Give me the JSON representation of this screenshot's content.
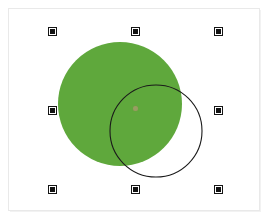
{
  "app": {
    "type": "vector-graphics-canvas",
    "background_color": "#ffffff",
    "width": 268,
    "height": 219
  },
  "canvas": {
    "frame": {
      "x": 8,
      "y": 8,
      "width": 252,
      "height": 203,
      "border_color": "#e9e9e9",
      "fill_color": "#ffffff"
    }
  },
  "shapes": [
    {
      "name": "green-filled-circle",
      "type": "circle",
      "cx": 120,
      "cy": 104,
      "r": 62,
      "fill": "#5FA83C",
      "stroke": "none",
      "selected": true
    },
    {
      "name": "outlined-circle",
      "type": "circle",
      "cx": 156,
      "cy": 131,
      "r": 46,
      "fill": "none",
      "stroke": "#1a1a1a",
      "stroke_width": 1,
      "selected": false
    }
  ],
  "selection": {
    "object": "green-filled-circle",
    "handle_color": "#121212",
    "handle_size": 7,
    "bounds": {
      "left": 49,
      "top": 28,
      "right": 215,
      "bottom": 186
    },
    "handles": [
      {
        "name": "handle-top-left",
        "x": 49,
        "y": 28
      },
      {
        "name": "handle-top-center",
        "x": 132,
        "y": 28
      },
      {
        "name": "handle-top-right",
        "x": 215,
        "y": 28
      },
      {
        "name": "handle-middle-left",
        "x": 49,
        "y": 107
      },
      {
        "name": "handle-middle-right",
        "x": 215,
        "y": 107
      },
      {
        "name": "handle-bottom-left",
        "x": 49,
        "y": 186
      },
      {
        "name": "handle-bottom-center",
        "x": 132,
        "y": 186
      },
      {
        "name": "handle-bottom-right",
        "x": 215,
        "y": 186
      }
    ],
    "center_marker": {
      "name": "rotation-center-marker",
      "x": 135,
      "y": 108,
      "color": "#c69682"
    }
  }
}
